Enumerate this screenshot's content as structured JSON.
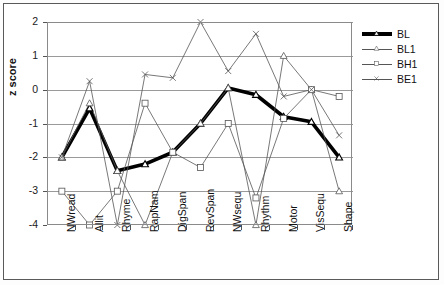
{
  "chart_data": {
    "type": "line",
    "title": "",
    "xlabel": "",
    "ylabel": "z score",
    "ylim": [
      -4,
      2
    ],
    "yticks": [
      2,
      1,
      0,
      -1,
      -2,
      -3,
      -4
    ],
    "ytick_labels": [
      "2",
      "1",
      "0",
      "-1",
      "-2",
      "-3",
      "-4"
    ],
    "grid": true,
    "legend_position": "right",
    "categories": [
      "NWread",
      "Allit",
      "Rhyme",
      "RapNam",
      "DigSpan",
      "RevSpan",
      "NWsequ",
      "Rhythm",
      "Motor",
      "VisSequ",
      "Shape"
    ],
    "series": [
      {
        "name": "BL",
        "marker": "triangle",
        "color": "#000000",
        "width": 3.6,
        "values": [
          -2.0,
          -0.55,
          -2.4,
          -2.2,
          -1.85,
          -1.0,
          0.05,
          -0.15,
          -0.8,
          -0.95,
          -2.0
        ]
      },
      {
        "name": "BL1",
        "marker": "triangle",
        "color": "#555555",
        "width": 0.8,
        "values": [
          -2.0,
          -0.4,
          -2.4,
          -4.0,
          -1.85,
          -1.0,
          0.05,
          -4.0,
          1.0,
          0.0,
          -3.0
        ]
      },
      {
        "name": "BH1",
        "marker": "square",
        "color": "#555555",
        "width": 0.8,
        "values": [
          -3.0,
          -4.0,
          -3.0,
          -0.4,
          -1.85,
          -2.3,
          -1.0,
          -3.2,
          -0.85,
          0.0,
          -0.2
        ]
      },
      {
        "name": "BE1",
        "marker": "x",
        "color": "#555555",
        "width": 0.8,
        "values": [
          -2.0,
          0.25,
          -4.0,
          0.45,
          0.35,
          2.0,
          0.55,
          1.65,
          -0.2,
          0.0,
          -1.35
        ]
      }
    ]
  },
  "legend": {
    "items": [
      {
        "label": "BL"
      },
      {
        "label": "BL1"
      },
      {
        "label": "BH1"
      },
      {
        "label": "BE1"
      }
    ]
  }
}
